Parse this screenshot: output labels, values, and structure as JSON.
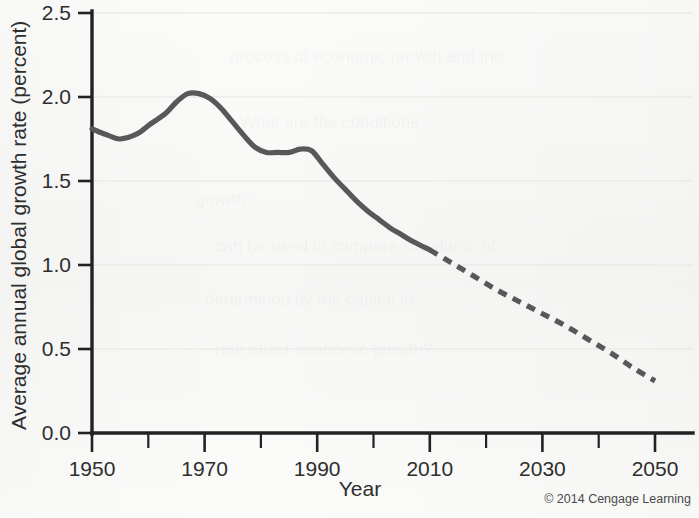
{
  "chart_data": {
    "type": "line",
    "title": "",
    "xlabel": "Year",
    "ylabel": "Average annual global growth rate (percent)",
    "xlim": [
      1950,
      2050
    ],
    "ylim": [
      0.0,
      2.5
    ],
    "grid": true,
    "legend": null,
    "x_ticks_major": [
      1950,
      1970,
      1990,
      2010,
      2030,
      2050
    ],
    "x_ticks_minor": [
      1960,
      1980,
      2000,
      2020,
      2040
    ],
    "y_ticks": [
      "0.0",
      "0.5",
      "1.0",
      "1.5",
      "2.0",
      "2.5"
    ],
    "y_tick_values": [
      0.0,
      0.5,
      1.0,
      1.5,
      2.0,
      2.5
    ],
    "series": [
      {
        "name": "Observed (historical)",
        "style": "solid",
        "x": [
          1950,
          1953,
          1955,
          1958,
          1960,
          1963,
          1965,
          1967,
          1969,
          1971,
          1973,
          1975,
          1977,
          1979,
          1981,
          1983,
          1985,
          1987,
          1989,
          1991,
          1993,
          1995,
          1997,
          1999,
          2001,
          2003,
          2005,
          2007,
          2010
        ],
        "values": [
          1.81,
          1.77,
          1.75,
          1.78,
          1.83,
          1.9,
          1.97,
          2.02,
          2.02,
          1.99,
          1.93,
          1.85,
          1.77,
          1.7,
          1.67,
          1.67,
          1.67,
          1.69,
          1.68,
          1.6,
          1.52,
          1.45,
          1.38,
          1.32,
          1.27,
          1.22,
          1.18,
          1.14,
          1.09
        ]
      },
      {
        "name": "Projected",
        "style": "dashed",
        "x": [
          2010,
          2014,
          2018,
          2022,
          2026,
          2030,
          2034,
          2038,
          2042,
          2046,
          2050
        ],
        "values": [
          1.09,
          1.01,
          0.93,
          0.85,
          0.78,
          0.71,
          0.64,
          0.56,
          0.48,
          0.39,
          0.31
        ]
      }
    ],
    "projection_start_year": 2010
  },
  "credit": {
    "text": "© 2014 Cengage Learning"
  },
  "ghost_lines": [
    "process of economic growth and the",
    "What are the conditions",
    "growth?",
    "can be used to compare standards of",
    "determined by the capital to",
    "rate affect economic growth?"
  ]
}
